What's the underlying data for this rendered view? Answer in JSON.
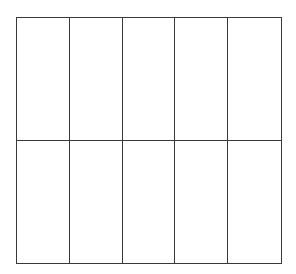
{
  "grid": {
    "rows": 2,
    "columns": 5,
    "line_color": "#3a3a3a",
    "background": "#ffffff",
    "cells": [
      [
        "",
        "",
        "",
        "",
        ""
      ],
      [
        "",
        "",
        "",
        "",
        ""
      ]
    ]
  }
}
